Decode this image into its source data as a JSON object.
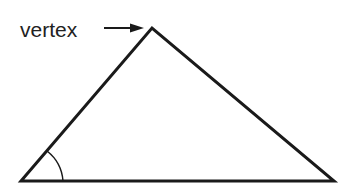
{
  "diagram": {
    "type": "triangle",
    "label": "vertex",
    "annotations": [
      "arrow pointing from label to top vertex",
      "angle arc at bottom-left vertex"
    ],
    "stroke_color": "#1a1a1a",
    "background": "#ffffff"
  }
}
